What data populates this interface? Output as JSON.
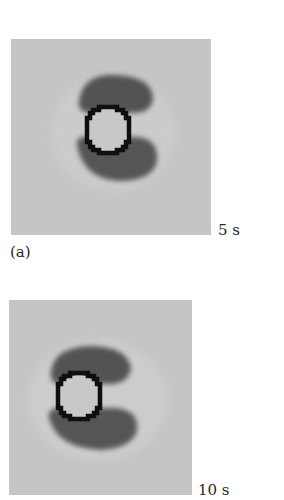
{
  "figure": {
    "subfigure_label": "(a)",
    "panels": [
      {
        "time_label": "5 s",
        "background_color": "#c5c5c5",
        "ring_color": "#101010",
        "wake_color": "#4a4a4a"
      },
      {
        "time_label": "10 s",
        "background_color": "#c5c5c5",
        "ring_color": "#101010",
        "wake_color": "#4a4a4a"
      }
    ]
  }
}
